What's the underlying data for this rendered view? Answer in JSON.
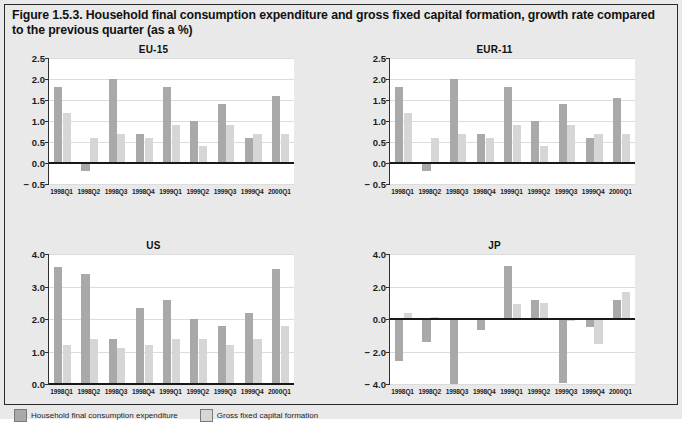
{
  "figure": {
    "title": "Figure 1.5.3. Household final consumption expenditure and gross fixed capital formation, growth rate compared to the previous quarter (as a %)",
    "background_color": "#e9e9e9",
    "frame_color": "#2b2b2b"
  },
  "legend": {
    "items": [
      {
        "label": "Household final consumption expenditure",
        "color": "#a9a9a9",
        "swatch": "dark-gray-swatch"
      },
      {
        "label": "Gross fixed capital formation",
        "color": "#d6d6d6",
        "swatch": "light-gray-swatch"
      }
    ]
  },
  "chart_data": [
    {
      "type": "bar",
      "title": "EU-15",
      "xlabel": "",
      "ylabel": "",
      "ylim": [
        -0.5,
        2.5
      ],
      "yticks": [
        -0.5,
        0.0,
        0.5,
        1.0,
        1.5,
        2.0,
        2.5
      ],
      "ytick_labels": [
        "− 0.5",
        "0.0",
        "0.5",
        "1.0",
        "1.5",
        "2.0",
        "2.5"
      ],
      "grid": true,
      "legend_position": "below-figure",
      "categories": [
        "1998Q1",
        "1998Q2",
        "1998Q3",
        "1998Q4",
        "1999Q1",
        "1999Q2",
        "1999Q3",
        "1999Q4",
        "2000Q1"
      ],
      "series": [
        {
          "name": "Household final consumption expenditure",
          "color": "#a9a9a9",
          "values": [
            1.8,
            -0.2,
            2.0,
            0.7,
            1.8,
            1.0,
            1.4,
            0.6,
            1.6
          ]
        },
        {
          "name": "Gross fixed capital formation",
          "color": "#d6d6d6",
          "values": [
            1.2,
            0.6,
            0.7,
            0.6,
            0.9,
            0.4,
            0.9,
            0.7,
            0.7
          ]
        }
      ]
    },
    {
      "type": "bar",
      "title": "EUR-11",
      "xlabel": "",
      "ylabel": "",
      "ylim": [
        -0.5,
        2.5
      ],
      "yticks": [
        -0.5,
        0.0,
        0.5,
        1.0,
        1.5,
        2.0,
        2.5
      ],
      "ytick_labels": [
        "− 0.5",
        "0.0",
        "0.5",
        "1.0",
        "1.5",
        "2.0",
        "2.5"
      ],
      "grid": true,
      "legend_position": "below-figure",
      "categories": [
        "1998Q1",
        "1998Q2",
        "1998Q3",
        "1998Q4",
        "1999Q1",
        "1999Q2",
        "1999Q3",
        "1999Q4",
        "2000Q1"
      ],
      "series": [
        {
          "name": "Household final consumption expenditure",
          "color": "#a9a9a9",
          "values": [
            1.8,
            -0.2,
            2.0,
            0.7,
            1.8,
            1.0,
            1.4,
            0.6,
            1.55
          ]
        },
        {
          "name": "Gross fixed capital formation",
          "color": "#d6d6d6",
          "values": [
            1.2,
            0.6,
            0.7,
            0.6,
            0.9,
            0.4,
            0.9,
            0.7,
            0.7
          ]
        }
      ]
    },
    {
      "type": "bar",
      "title": "US",
      "xlabel": "",
      "ylabel": "",
      "ylim": [
        0.0,
        4.0
      ],
      "yticks": [
        0.0,
        1.0,
        2.0,
        3.0,
        4.0
      ],
      "ytick_labels": [
        "0.0",
        "1.0",
        "2.0",
        "3.0",
        "4.0"
      ],
      "grid": true,
      "legend_position": "below-figure",
      "categories": [
        "1998Q1",
        "1998Q2",
        "1998Q3",
        "1998Q4",
        "1999Q1",
        "1999Q2",
        "1999Q3",
        "1999Q4",
        "2000Q1"
      ],
      "series": [
        {
          "name": "Household final consumption expenditure",
          "color": "#a9a9a9",
          "values": [
            3.6,
            3.4,
            1.4,
            2.35,
            2.6,
            2.0,
            1.8,
            2.2,
            3.55
          ]
        },
        {
          "name": "Gross fixed capital formation",
          "color": "#d6d6d6",
          "values": [
            1.2,
            1.4,
            1.1,
            1.2,
            1.4,
            1.4,
            1.2,
            1.4,
            1.8
          ]
        }
      ]
    },
    {
      "type": "bar",
      "title": "JP",
      "xlabel": "",
      "ylabel": "",
      "ylim": [
        -4.0,
        4.0
      ],
      "yticks": [
        -4.0,
        -2.0,
        0.0,
        2.0,
        4.0
      ],
      "ytick_labels": [
        "− 4.0",
        "− 2.0",
        "0.0",
        "2.0",
        "4.0"
      ],
      "grid": true,
      "legend_position": "below-figure",
      "categories": [
        "1998Q1",
        "1998Q2",
        "1998Q3",
        "1998Q4",
        "1999Q1",
        "1999Q2",
        "1999Q3",
        "1999Q4",
        "2000Q1"
      ],
      "series": [
        {
          "name": "Household final consumption expenditure",
          "color": "#a9a9a9",
          "values": [
            -2.6,
            -1.4,
            -4.0,
            -0.7,
            3.25,
            1.2,
            -3.95,
            -0.5,
            1.15
          ]
        },
        {
          "name": "Gross fixed capital formation",
          "color": "#d6d6d6",
          "values": [
            0.4,
            0.15,
            0.0,
            0.0,
            0.9,
            1.0,
            -0.15,
            -1.55,
            1.65
          ]
        }
      ]
    }
  ]
}
